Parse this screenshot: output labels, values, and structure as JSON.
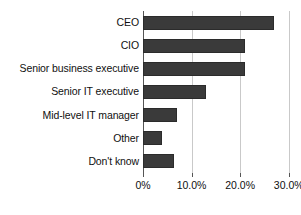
{
  "chart_data": {
    "type": "bar",
    "orientation": "horizontal",
    "title": "",
    "subtitle": "",
    "xlabel": "",
    "ylabel": "",
    "categories": [
      "CEO",
      "CIO",
      "Senior business executive",
      "Senior IT executive",
      "Mid-level IT manager",
      "Other",
      "Don't know"
    ],
    "values": [
      27.0,
      21.0,
      21.0,
      13.0,
      7.0,
      4.0,
      6.3
    ],
    "value_format": "percent",
    "xlim": [
      0,
      31.5
    ],
    "xticks": [
      0,
      10,
      20,
      30
    ],
    "xtick_labels": [
      "0%",
      "10.0%",
      "20.0%",
      "30.0%"
    ],
    "grid": true,
    "grid_axis": "x",
    "legend": false,
    "legend_position": "none",
    "annotations": [],
    "colors": {
      "bar_fill": "#3a3a3a",
      "bar_edge": "#2b2b2b",
      "gridline": "#c9c9c9",
      "axis": "#555555",
      "text": "#101010",
      "background": "#ffffff"
    }
  }
}
